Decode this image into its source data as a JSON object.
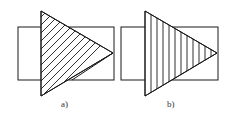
{
  "figures": [
    {
      "id": "a",
      "label": "a)",
      "hatch": "diagonal",
      "rect": {
        "x": 18,
        "y": 27,
        "w": 96,
        "h": 53
      },
      "triangle": {
        "left_x": 41,
        "top_y": 11,
        "bottom_y": 96,
        "tip_x": 113,
        "tip_y": 53
      }
    },
    {
      "id": "b",
      "label": "b)",
      "hatch": "vertical",
      "rect": {
        "x": 121,
        "y": 27,
        "w": 97,
        "h": 53
      },
      "triangle": {
        "left_x": 145,
        "top_y": 11,
        "bottom_y": 96,
        "tip_x": 217,
        "tip_y": 53
      }
    }
  ],
  "colors": {
    "stroke": "#1a1a1a",
    "background": "#ffffff"
  }
}
